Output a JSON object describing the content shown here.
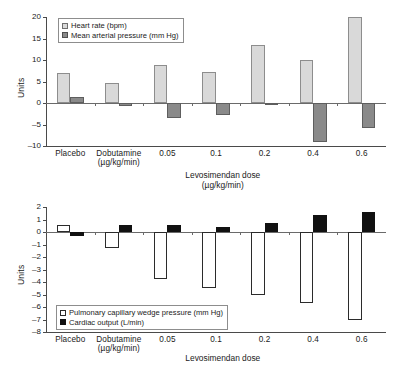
{
  "chart_data": [
    {
      "type": "bar",
      "id": "hemodynamic-chart-top",
      "title": "",
      "xlabel": "Levosimendan dose",
      "xlabel_sub": "(µg/kg/min)",
      "ylabel": "Units",
      "ylim": [
        -10,
        20
      ],
      "yticks": [
        20,
        15,
        10,
        5,
        0,
        -5,
        -10
      ],
      "ytick_labels": [
        "20",
        "15",
        "10",
        "5",
        "0",
        "–5",
        "–10"
      ],
      "grid": false,
      "legend_position": "top-left",
      "categories": [
        "Placebo",
        "Dobutamine",
        "0.05",
        "0.1",
        "0.2",
        "0.4",
        "0.6"
      ],
      "category_subs": [
        "",
        "(µg/kg/min)",
        "",
        "",
        "",
        "",
        ""
      ],
      "series": [
        {
          "name": "Heart rate (bpm)",
          "color": "#d9d9d9",
          "edge": "#8d8d8d",
          "values": [
            7.0,
            4.7,
            8.8,
            7.2,
            13.5,
            9.9,
            20.0
          ]
        },
        {
          "name": "Mean arterial pressure (mm Hg)",
          "color": "#8a8a8a",
          "edge": "#5e5e5e",
          "values": [
            1.5,
            -0.8,
            -3.4,
            -2.7,
            -0.4,
            -9.1,
            -5.7
          ]
        }
      ]
    },
    {
      "type": "bar",
      "id": "hemodynamic-chart-bottom",
      "title": "",
      "xlabel": "Levosimendan dose",
      "xlabel_sub": "",
      "ylabel": "Units",
      "ylim": [
        -8,
        2
      ],
      "yticks": [
        2,
        1,
        0,
        -1,
        -2,
        -3,
        -4,
        -5,
        -6,
        -7,
        -8
      ],
      "ytick_labels": [
        "2",
        "1",
        "0",
        "–1",
        "–2",
        "–3",
        "–4",
        "–5",
        "–6",
        "–7",
        "–8"
      ],
      "grid": false,
      "legend_position": "bottom-left",
      "categories": [
        "Placebo",
        "Dobutamine",
        "0.05",
        "0.1",
        "0.2",
        "0.4",
        "0.6"
      ],
      "category_subs": [
        "",
        "(µg/kg/min)",
        "",
        "",
        "",
        "",
        ""
      ],
      "series": [
        {
          "name": "Pulmonary capillary wedge pressure (mm Hg)",
          "color": "#ffffff",
          "edge": "#2b2b2b",
          "values": [
            0.6,
            -1.25,
            -3.75,
            -4.5,
            -5.0,
            -5.65,
            -7.05
          ]
        },
        {
          "name": "Cardiac output (L/min)",
          "color": "#111111",
          "edge": "#111111",
          "values": [
            -0.3,
            0.55,
            0.55,
            0.4,
            0.75,
            1.35,
            1.6
          ]
        }
      ]
    }
  ]
}
